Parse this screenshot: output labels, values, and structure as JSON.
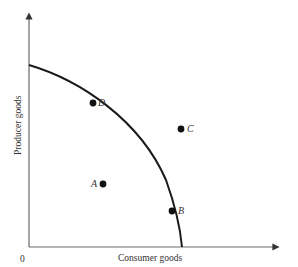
{
  "diagram": {
    "type": "production-possibilities-frontier",
    "x_axis_label": "Consumer goods",
    "y_axis_label": "Producer goods",
    "origin_label": "0",
    "colors": {
      "axis": "#6a6a6a",
      "curve": "#1a1a1a",
      "points": "#111111"
    },
    "points": [
      {
        "label": "A",
        "position": "inside curve"
      },
      {
        "label": "B",
        "position": "on curve (lower)"
      },
      {
        "label": "C",
        "position": "outside curve"
      },
      {
        "label": "D",
        "position": "on curve (upper)"
      }
    ]
  }
}
